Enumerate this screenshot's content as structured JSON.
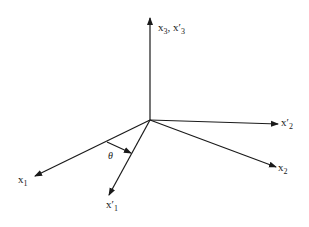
{
  "diagram": {
    "type": "coordinate-rotation",
    "origin": [
      150,
      120
    ],
    "stroke_color": "#1a1a1a",
    "axes": [
      {
        "id": "x3",
        "label": "x",
        "sub": "3",
        "label2": "x′",
        "sub2": "3",
        "sep": ",",
        "end": [
          150,
          18
        ]
      },
      {
        "id": "x2p",
        "label": "x′",
        "sub": "2",
        "end": [
          278,
          124
        ]
      },
      {
        "id": "x2",
        "label": "x",
        "sub": "2",
        "end": [
          276,
          167
        ]
      },
      {
        "id": "x1",
        "label": "x",
        "sub": "1",
        "end": [
          35,
          176
        ]
      },
      {
        "id": "x1p",
        "label": "x′",
        "sub": "1",
        "end": [
          109,
          195
        ]
      }
    ],
    "angle": {
      "symbol": "θ"
    }
  }
}
